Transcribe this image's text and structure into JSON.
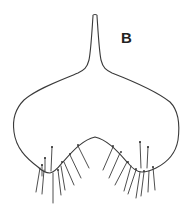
{
  "figure": {
    "panel_label": "B",
    "stroke_color": "#3a3a3a",
    "background": "#ffffff"
  }
}
